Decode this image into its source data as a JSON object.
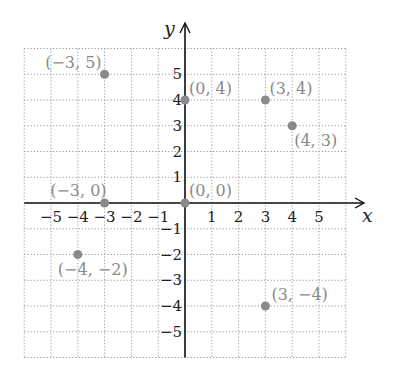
{
  "chart_data": {
    "type": "scatter",
    "title": "",
    "xlabel": "x",
    "ylabel": "y",
    "xlim": [
      -6,
      6
    ],
    "ylim": [
      -6,
      6
    ],
    "grid": true,
    "x_ticks": [
      "−5",
      "−4",
      "−3",
      "−2",
      "−1",
      "1",
      "2",
      "3",
      "4",
      "5"
    ],
    "y_ticks": [
      "5",
      "4",
      "3",
      "2",
      "1",
      "−1",
      "−2",
      "−3",
      "−4",
      "−5"
    ],
    "points": [
      {
        "x": -3,
        "y": 5,
        "label": "(−3, 5)"
      },
      {
        "x": 0,
        "y": 4,
        "label": "(0, 4)"
      },
      {
        "x": 3,
        "y": 4,
        "label": "(3, 4)"
      },
      {
        "x": 4,
        "y": 3,
        "label": "(4, 3)"
      },
      {
        "x": -3,
        "y": 0,
        "label": "(−3, 0)"
      },
      {
        "x": 0,
        "y": 0,
        "label": "(0, 0)"
      },
      {
        "x": -4,
        "y": -2,
        "label": "(−4, −2)"
      },
      {
        "x": 3,
        "y": -4,
        "label": "(3, −4)"
      }
    ],
    "point_color": "#8a8a8a"
  }
}
